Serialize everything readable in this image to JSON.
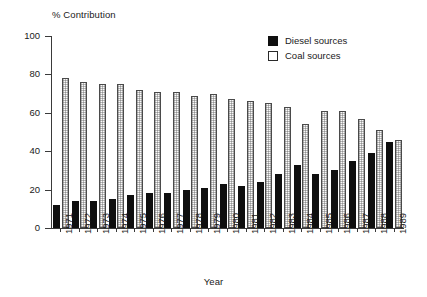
{
  "chart_data": {
    "type": "bar",
    "title": "",
    "ylabel": "% Contribution",
    "xlabel": "Year",
    "ylim": [
      0,
      100
    ],
    "yticks": [
      0,
      20,
      40,
      60,
      80,
      100
    ],
    "grid": false,
    "legend_position": "top-right",
    "categories": [
      "1971",
      "1972",
      "1973",
      "1974",
      "1975",
      "1976",
      "1977",
      "1978",
      "1979",
      "1980",
      "1981",
      "1982",
      "1983",
      "1984",
      "1985",
      "1986",
      "1987",
      "1988",
      "1989"
    ],
    "series": [
      {
        "name": "Diesel sources",
        "style": "filled-black",
        "color": "#0f0f0f",
        "values": [
          12,
          14,
          14,
          15,
          17,
          18,
          18,
          20,
          21,
          23,
          22,
          24,
          28,
          33,
          28,
          30,
          35,
          39,
          45
        ]
      },
      {
        "name": "Coal sources",
        "style": "open-stippled",
        "color": "#ffffff",
        "values": [
          78,
          76,
          75,
          75,
          72,
          71,
          71,
          69,
          70,
          67,
          66,
          65,
          63,
          54,
          61,
          61,
          57,
          51,
          46
        ]
      }
    ]
  },
  "legend": {
    "items": [
      {
        "label": "Diesel sources",
        "swatch": "filled-black-square"
      },
      {
        "label": "Coal sources",
        "swatch": "open-square"
      }
    ]
  }
}
